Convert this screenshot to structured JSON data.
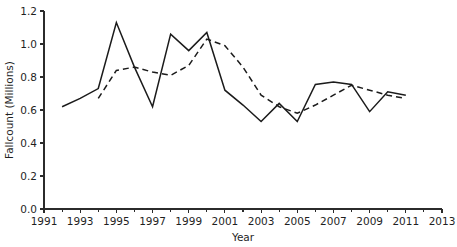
{
  "chart_data": {
    "type": "line",
    "title": "",
    "xlabel": "Year",
    "ylabel": "Fallcount (Millions)",
    "xlim": [
      1991,
      2013
    ],
    "ylim": [
      0.0,
      1.2
    ],
    "xticks": [
      1991,
      1993,
      1995,
      1997,
      1999,
      2001,
      2003,
      2005,
      2007,
      2009,
      2011,
      2013
    ],
    "xtick_labels": [
      "1991",
      "1993",
      "1995",
      "1997",
      "1999",
      "2001",
      "2003",
      "2005",
      "2007",
      "2009",
      "2011",
      "2013"
    ],
    "minor_xticks": [
      1992,
      1994,
      1996,
      1998,
      2000,
      2002,
      2004,
      2006,
      2008,
      2010,
      2012
    ],
    "yticks": [
      0.0,
      0.2,
      0.4,
      0.6,
      0.8,
      1.0,
      1.2
    ],
    "ytick_labels": [
      "0.0",
      "0.2",
      "0.4",
      "0.6",
      "0.8",
      "1.0",
      "1.2"
    ],
    "grid": false,
    "legend": null,
    "legend_position": "none",
    "series": [
      {
        "name": "solid-series",
        "style": "solid",
        "color": "#1b1b1b",
        "x": [
          1992,
          1993,
          1994,
          1995,
          1996,
          1997,
          1998,
          1999,
          2000,
          2001,
          2002,
          2003,
          2004,
          2005,
          2006,
          2007,
          2008,
          2009,
          2010,
          2011
        ],
        "values": [
          0.62,
          0.67,
          0.73,
          1.13,
          0.86,
          0.62,
          1.06,
          0.96,
          1.07,
          0.72,
          0.63,
          0.53,
          0.64,
          0.53,
          0.755,
          0.77,
          0.755,
          0.59,
          0.71,
          0.69
        ]
      },
      {
        "name": "dashed-series",
        "style": "dashed",
        "color": "#1b1b1b",
        "x": [
          1994,
          1995,
          1996,
          1997,
          1998,
          1999,
          2000,
          2001,
          2002,
          2003,
          2004,
          2005,
          2006,
          2007,
          2008,
          2009,
          2010,
          2011
        ],
        "values": [
          0.67,
          0.84,
          0.86,
          0.83,
          0.81,
          0.87,
          1.03,
          0.99,
          0.86,
          0.69,
          0.62,
          0.58,
          0.63,
          0.69,
          0.75,
          0.72,
          0.69,
          0.67
        ]
      }
    ]
  }
}
